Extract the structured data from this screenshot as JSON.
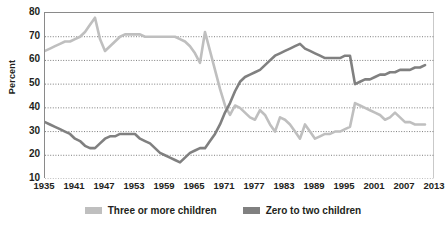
{
  "chart_data": {
    "type": "line",
    "title": "",
    "xlabel": "",
    "ylabel": "Percent",
    "ylim": [
      10,
      80
    ],
    "ytick_step": 10,
    "yticks": [
      80,
      70,
      60,
      50,
      40,
      30,
      20,
      10
    ],
    "xlim": [
      1935,
      2013
    ],
    "xticks": [
      1935,
      1941,
      1947,
      1953,
      1959,
      1965,
      1971,
      1977,
      1983,
      1989,
      1995,
      2001,
      2007,
      2013
    ],
    "grid": "horizontal-dotted",
    "legend_position": "bottom",
    "x": [
      1935,
      1936,
      1937,
      1938,
      1939,
      1940,
      1941,
      1942,
      1943,
      1944,
      1945,
      1946,
      1947,
      1948,
      1949,
      1950,
      1951,
      1952,
      1953,
      1954,
      1955,
      1956,
      1957,
      1958,
      1959,
      1960,
      1961,
      1962,
      1963,
      1964,
      1965,
      1966,
      1967,
      1968,
      1969,
      1970,
      1971,
      1972,
      1973,
      1974,
      1975,
      1976,
      1977,
      1978,
      1979,
      1980,
      1981,
      1982,
      1983,
      1984,
      1985,
      1986,
      1987,
      1988,
      1989,
      1990,
      1991,
      1992,
      1993,
      1994,
      1995,
      1996,
      1997,
      1998,
      1999,
      2000,
      2001,
      2002,
      2003,
      2004,
      2005,
      2006,
      2007,
      2008,
      2009,
      2010,
      2011
    ],
    "series": [
      {
        "name": "Three or more children",
        "color": "#bfbfbf",
        "values": [
          64,
          65,
          66,
          67,
          68,
          68,
          69,
          70,
          72,
          75,
          78,
          69,
          64,
          66,
          68,
          70,
          71,
          71,
          71,
          71,
          70,
          70,
          70,
          70,
          70,
          70,
          70,
          69,
          68,
          66,
          63,
          59,
          72,
          64,
          56,
          48,
          41,
          37,
          41,
          40,
          38,
          36,
          35,
          39,
          37,
          33,
          30,
          36,
          35,
          33,
          30,
          27,
          33,
          30,
          27,
          28,
          29,
          29,
          30,
          30,
          31,
          32,
          42,
          41,
          40,
          39,
          38,
          37,
          35,
          36,
          38,
          36,
          34,
          34,
          33,
          33,
          33
        ]
      },
      {
        "name": "Zero to two children",
        "color": "#808080",
        "values": [
          34,
          33,
          32,
          31,
          30,
          29,
          27,
          26,
          24,
          23,
          23,
          25,
          27,
          28,
          28,
          29,
          29,
          29,
          29,
          27,
          26,
          25,
          23,
          21,
          20,
          19,
          18,
          17,
          19,
          21,
          22,
          23,
          23,
          26,
          29,
          33,
          38,
          42,
          47,
          51,
          53,
          54,
          55,
          56,
          58,
          60,
          62,
          63,
          64,
          65,
          66,
          67,
          65,
          64,
          63,
          62,
          61,
          61,
          61,
          61,
          62,
          62,
          50,
          51,
          52,
          52,
          53,
          54,
          54,
          55,
          55,
          56,
          56,
          56,
          57,
          57,
          58
        ]
      }
    ]
  },
  "legend": {
    "items": [
      {
        "label": "Three or more children",
        "color": "#bfbfbf"
      },
      {
        "label": "Zero to two children",
        "color": "#808080"
      }
    ]
  },
  "axes": {
    "y_title": "Percent"
  }
}
